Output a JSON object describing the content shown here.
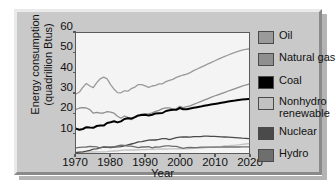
{
  "chart_data": {
    "type": "line",
    "title": "",
    "xlabel": "Year",
    "ylabel": "Energy consumption\n(quadrillion Btus)",
    "ylabel_line1": "Energy consumption",
    "ylabel_line2": "(quadrillion Btus)",
    "xlim": [
      1970,
      2020
    ],
    "ylim": [
      0,
      60
    ],
    "xticks": [
      1970,
      1980,
      1990,
      2000,
      2010,
      2020
    ],
    "yticks": [
      10,
      20,
      30,
      40,
      50,
      60
    ],
    "grid": false,
    "legend_position": "right",
    "x": [
      1970,
      1971,
      1972,
      1973,
      1974,
      1975,
      1976,
      1977,
      1978,
      1979,
      1980,
      1981,
      1982,
      1983,
      1984,
      1985,
      1986,
      1987,
      1988,
      1989,
      1990,
      1991,
      1992,
      1993,
      1994,
      1995,
      1996,
      1997,
      1998,
      1999,
      2000,
      2001,
      2002,
      2003,
      2004,
      2005,
      2006,
      2007,
      2008,
      2009,
      2010,
      2011,
      2012,
      2013,
      2014,
      2015,
      2016,
      2017,
      2018,
      2019,
      2020
    ],
    "series": [
      {
        "name": "Oil",
        "color": "#9a9a9a",
        "values": [
          29.5,
          30.5,
          32.9,
          34.8,
          33.5,
          32.7,
          35.2,
          37.1,
          37.9,
          37.1,
          34.2,
          31.9,
          30.2,
          30.1,
          31.1,
          30.9,
          32.2,
          32.9,
          34.2,
          34.2,
          33.6,
          32.8,
          33.5,
          33.8,
          34.6,
          34.6,
          35.7,
          36.3,
          36.8,
          37.8,
          38.4,
          39.0,
          39.4,
          40.2,
          41.2,
          42.0,
          42.8,
          43.6,
          44.4,
          45.2,
          46.0,
          46.8,
          47.6,
          48.3,
          49.0,
          49.7,
          50.3,
          50.9,
          51.4,
          51.8,
          52.0
        ]
      },
      {
        "name": "Natural gas",
        "color": "#8f8f8f",
        "values": [
          21.8,
          22.5,
          22.7,
          22.5,
          21.7,
          19.9,
          20.3,
          19.9,
          20.0,
          20.7,
          20.4,
          19.9,
          18.4,
          17.4,
          18.5,
          17.8,
          16.7,
          17.7,
          18.6,
          19.4,
          19.6,
          19.6,
          20.1,
          20.8,
          21.3,
          22.2,
          22.6,
          22.6,
          21.9,
          22.1,
          23.3,
          22.7,
          23.2,
          23.6,
          24.3,
          25.0,
          25.7,
          26.4,
          27.1,
          27.8,
          28.5,
          29.1,
          29.7,
          30.3,
          31.0,
          31.6,
          32.2,
          32.8,
          33.4,
          34.0,
          34.5
        ]
      },
      {
        "name": "Coal",
        "color": "#000000",
        "values": [
          12.2,
          11.6,
          12.0,
          12.9,
          12.7,
          12.6,
          13.5,
          13.8,
          13.7,
          15.0,
          15.4,
          15.9,
          15.3,
          15.8,
          17.0,
          17.4,
          17.2,
          17.9,
          18.8,
          19.0,
          19.1,
          18.8,
          19.1,
          19.8,
          19.9,
          20.0,
          21.0,
          21.4,
          21.6,
          21.6,
          22.5,
          21.9,
          21.9,
          22.3,
          22.6,
          22.9,
          23.2,
          23.6,
          23.9,
          24.2,
          24.5,
          24.8,
          25.1,
          25.4,
          25.7,
          26.0,
          26.2,
          26.5,
          26.7,
          26.9,
          27.0
        ]
      },
      {
        "name": "Nonhydro\nrenewable",
        "color": "#c2c2c2",
        "values": [
          0.4,
          0.4,
          0.5,
          0.5,
          0.5,
          0.5,
          0.6,
          0.6,
          0.6,
          0.7,
          0.9,
          1.0,
          1.1,
          1.3,
          1.4,
          1.5,
          1.5,
          1.5,
          1.6,
          1.7,
          1.7,
          1.8,
          1.8,
          1.9,
          1.9,
          2.0,
          2.0,
          2.1,
          2.1,
          2.1,
          2.2,
          2.1,
          2.1,
          2.2,
          2.3,
          2.4,
          2.5,
          2.6,
          2.8,
          2.9,
          3.0,
          3.2,
          3.3,
          3.5,
          3.6,
          3.8,
          3.9,
          4.1,
          4.3,
          4.5,
          4.7
        ]
      },
      {
        "name": "Nuclear",
        "color": "#4a4a4a",
        "values": [
          0.2,
          0.4,
          0.6,
          0.9,
          1.3,
          1.9,
          2.1,
          2.7,
          3.0,
          2.8,
          2.7,
          3.0,
          3.1,
          3.2,
          3.6,
          4.1,
          4.5,
          4.9,
          5.6,
          5.7,
          6.1,
          6.4,
          6.5,
          6.5,
          6.8,
          7.2,
          7.2,
          6.7,
          7.2,
          7.7,
          7.9,
          8.0,
          8.1,
          7.9,
          8.2,
          8.2,
          8.2,
          8.4,
          8.4,
          8.3,
          8.3,
          8.2,
          8.1,
          8.0,
          7.9,
          7.8,
          7.7,
          7.6,
          7.4,
          7.3,
          7.2
        ]
      },
      {
        "name": "Hydro",
        "color": "#6e6e6e",
        "values": [
          2.6,
          2.8,
          2.9,
          3.0,
          3.3,
          3.2,
          3.1,
          2.5,
          3.1,
          3.1,
          3.1,
          3.1,
          3.6,
          3.9,
          3.8,
          3.4,
          3.4,
          3.1,
          2.7,
          3.0,
          3.0,
          3.2,
          2.6,
          3.0,
          2.9,
          3.3,
          3.6,
          3.6,
          3.3,
          3.3,
          2.8,
          2.3,
          2.7,
          2.8,
          2.7,
          2.7,
          2.9,
          2.9,
          2.9,
          2.9,
          2.9,
          2.9,
          2.9,
          3.0,
          3.0,
          3.0,
          3.0,
          3.0,
          3.1,
          3.1,
          3.1
        ]
      }
    ]
  },
  "legend": {
    "items": [
      {
        "label": "Oil",
        "color": "#9a9a9a"
      },
      {
        "label": "Natural gas",
        "color": "#8f8f8f"
      },
      {
        "label": "Coal",
        "color": "#000000"
      },
      {
        "label": "Nonhydro\nrenewable",
        "color": "#c2c2c2"
      },
      {
        "label": "Nuclear",
        "color": "#4a4a4a"
      },
      {
        "label": "Hydro",
        "color": "#6e6e6e"
      }
    ]
  }
}
